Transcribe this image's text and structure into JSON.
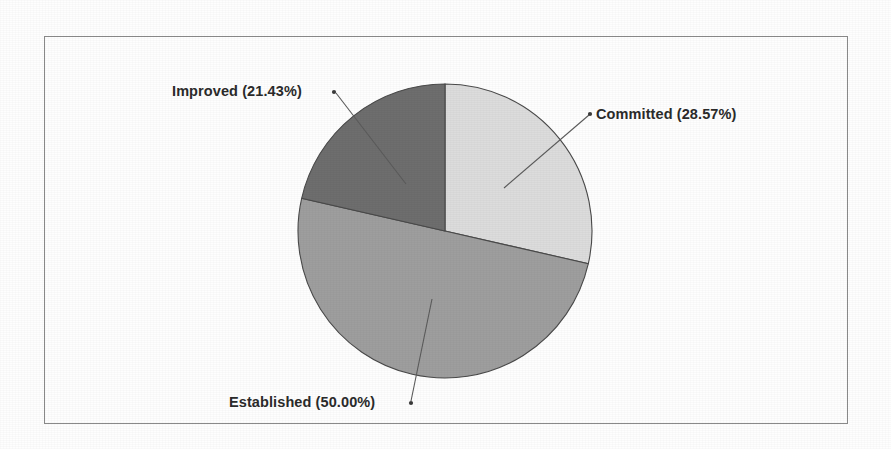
{
  "chart_data": {
    "type": "pie",
    "title": "",
    "labels": [
      "Committed",
      "Established",
      "Improved"
    ],
    "values": [
      28.57,
      50.0,
      21.43
    ],
    "value_unit": "%",
    "data_labels": [
      "Committed (28.57%)",
      "Established (50.00%)",
      "Improved (21.43%)"
    ],
    "slice_colors": [
      "#dcdcdc",
      "#9e9e9e",
      "#6e6e6e"
    ],
    "start_angle_deg": 0,
    "direction": "clockwise",
    "legend": "none",
    "grid": false,
    "label_style": "callout-with-leader-line"
  },
  "chart": {
    "border_color": "#8a8a8a",
    "background": "#ffffff",
    "outline_color": "#4a4a4a",
    "center_x": 445,
    "center_y": 231,
    "radius": 147
  },
  "labels": {
    "improved": "Improved (21.43%)",
    "committed": "Committed (28.57%)",
    "established": "Established (50.00%)"
  }
}
